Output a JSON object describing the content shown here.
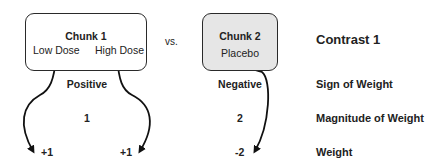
{
  "title": "Contrast 1",
  "vs_label": "vs.",
  "chunks": [
    {
      "name": "Chunk 1",
      "conditions": [
        "Low Dose",
        "High Dose"
      ],
      "fill": "#ffffff",
      "sign": "Positive",
      "magnitude": "1",
      "weights": [
        "+1",
        "+1"
      ]
    },
    {
      "name": "Chunk 2",
      "conditions": [
        "Placebo"
      ],
      "fill": "#e6e6e6",
      "sign": "Negative",
      "magnitude": "2",
      "weights": [
        "-2"
      ]
    }
  ],
  "row_labels": {
    "sign": "Sign of Weight",
    "magnitude": "Magnitude of Weight",
    "weight": "Weight"
  }
}
